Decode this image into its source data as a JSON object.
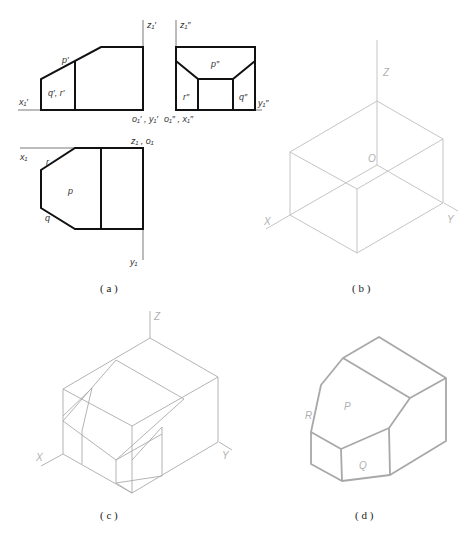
{
  "figure": {
    "panels": [
      {
        "id": "a",
        "caption": "( a )",
        "description": "Three orthographic projections (front, side, top views)",
        "front_view": {
          "axis_top": "z₁′",
          "axis_left": "x₁′",
          "origin": "o₁′ , y₁′",
          "label_plane": "p′",
          "label_faces": "q′, r′"
        },
        "side_view": {
          "axis_top": "z₁″",
          "axis_right": "y₁″",
          "origin": "o₁″ , x₁″",
          "label_top": "p″",
          "label_left": "r″",
          "label_right": "q″"
        },
        "top_view": {
          "axis_left": "x₁",
          "axis_origin": "z₁ , o₁",
          "axis_bottom": "y₁",
          "label_p": "p",
          "label_r": "r",
          "label_q": "q"
        }
      },
      {
        "id": "b",
        "caption": "( b )",
        "description": "Isometric bounding box with axes",
        "axis_z": "Z",
        "axis_x": "X",
        "axis_y": "Y",
        "origin": "O"
      },
      {
        "id": "c",
        "caption": "( c )",
        "description": "Construction lines inside isometric box",
        "axis_z": "Z",
        "axis_x": "X",
        "axis_y": "Y"
      },
      {
        "id": "d",
        "caption": "( d )",
        "description": "Finished isometric solid",
        "label_p": "P",
        "label_r": "R",
        "label_q": "Q"
      }
    ]
  }
}
